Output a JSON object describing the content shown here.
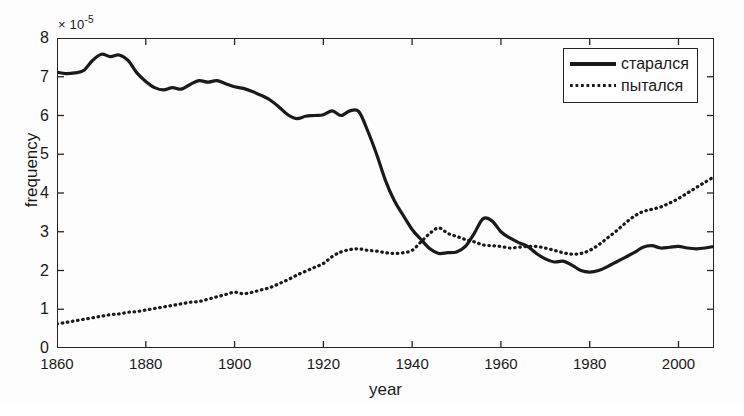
{
  "chart_data": {
    "type": "line",
    "title": "",
    "xlabel": "year",
    "ylabel": "frequency",
    "y_multiplier_times": "× 10",
    "y_multiplier_exponent": "-5",
    "y_multiplier_full": "× 10^-5",
    "xlim": [
      1860,
      2008
    ],
    "ylim": [
      0,
      8
    ],
    "xticks": [
      1860,
      1880,
      1900,
      1920,
      1940,
      1960,
      1980,
      2000
    ],
    "xtick_labels": [
      "1860",
      "1880",
      "1900",
      "1920",
      "1940",
      "1960",
      "1980",
      "2000"
    ],
    "yticks": [
      0,
      1,
      2,
      3,
      4,
      5,
      6,
      7,
      8
    ],
    "ytick_labels": [
      "0",
      "1",
      "2",
      "3",
      "4",
      "5",
      "6",
      "7",
      "8"
    ],
    "grid": false,
    "legend_position": "upper right",
    "legend_entries": [
      {
        "label": "старался",
        "style": "solid"
      },
      {
        "label": "пытался",
        "style": "dotted"
      }
    ],
    "series": [
      {
        "name": "старался",
        "style": "solid",
        "color": "#1a1a1a",
        "x": [
          1860,
          1862,
          1864,
          1866,
          1868,
          1870,
          1872,
          1874,
          1876,
          1878,
          1880,
          1882,
          1884,
          1886,
          1888,
          1890,
          1892,
          1894,
          1896,
          1898,
          1900,
          1902,
          1904,
          1906,
          1908,
          1910,
          1912,
          1914,
          1916,
          1918,
          1920,
          1922,
          1924,
          1926,
          1928,
          1930,
          1932,
          1934,
          1936,
          1938,
          1940,
          1942,
          1944,
          1946,
          1948,
          1950,
          1952,
          1954,
          1956,
          1958,
          1960,
          1962,
          1964,
          1966,
          1968,
          1970,
          1972,
          1974,
          1976,
          1978,
          1980,
          1982,
          1984,
          1986,
          1988,
          1990,
          1992,
          1994,
          1996,
          1998,
          2000,
          2002,
          2004,
          2006,
          2008
        ],
        "y": [
          7.12,
          7.08,
          7.1,
          7.16,
          7.42,
          7.58,
          7.52,
          7.56,
          7.42,
          7.1,
          6.88,
          6.72,
          6.66,
          6.72,
          6.68,
          6.8,
          6.9,
          6.86,
          6.9,
          6.82,
          6.74,
          6.7,
          6.62,
          6.52,
          6.4,
          6.22,
          6.02,
          5.92,
          5.98,
          6.0,
          6.02,
          6.12,
          6.0,
          6.12,
          6.1,
          5.6,
          5.0,
          4.32,
          3.8,
          3.42,
          3.06,
          2.8,
          2.56,
          2.44,
          2.46,
          2.48,
          2.62,
          2.96,
          3.34,
          3.28,
          3.0,
          2.84,
          2.72,
          2.62,
          2.44,
          2.3,
          2.22,
          2.24,
          2.14,
          2.0,
          1.96,
          2.0,
          2.1,
          2.22,
          2.34,
          2.46,
          2.6,
          2.64,
          2.58,
          2.6,
          2.62,
          2.58,
          2.56,
          2.58,
          2.62
        ]
      },
      {
        "name": "пытался",
        "style": "dotted",
        "color": "#1a1a1a",
        "x": [
          1860,
          1862,
          1864,
          1866,
          1868,
          1870,
          1872,
          1874,
          1876,
          1878,
          1880,
          1882,
          1884,
          1886,
          1888,
          1890,
          1892,
          1894,
          1896,
          1898,
          1900,
          1902,
          1904,
          1906,
          1908,
          1910,
          1912,
          1914,
          1916,
          1918,
          1920,
          1922,
          1924,
          1926,
          1928,
          1930,
          1932,
          1934,
          1936,
          1938,
          1940,
          1942,
          1944,
          1946,
          1948,
          1950,
          1952,
          1954,
          1956,
          1958,
          1960,
          1962,
          1964,
          1966,
          1968,
          1970,
          1972,
          1974,
          1976,
          1978,
          1980,
          1982,
          1984,
          1986,
          1988,
          1990,
          1992,
          1994,
          1996,
          1998,
          2000,
          2002,
          2004,
          2006,
          2008
        ],
        "y": [
          0.62,
          0.66,
          0.7,
          0.74,
          0.78,
          0.82,
          0.86,
          0.88,
          0.92,
          0.94,
          0.98,
          1.02,
          1.06,
          1.1,
          1.14,
          1.18,
          1.2,
          1.26,
          1.32,
          1.38,
          1.44,
          1.4,
          1.44,
          1.5,
          1.56,
          1.66,
          1.76,
          1.88,
          1.98,
          2.08,
          2.18,
          2.36,
          2.48,
          2.54,
          2.56,
          2.52,
          2.5,
          2.46,
          2.44,
          2.46,
          2.52,
          2.74,
          2.96,
          3.1,
          2.96,
          2.88,
          2.8,
          2.74,
          2.66,
          2.64,
          2.62,
          2.58,
          2.6,
          2.62,
          2.62,
          2.58,
          2.52,
          2.46,
          2.42,
          2.44,
          2.52,
          2.66,
          2.84,
          3.02,
          3.22,
          3.4,
          3.52,
          3.58,
          3.64,
          3.74,
          3.86,
          4.0,
          4.14,
          4.28,
          4.42
        ]
      }
    ]
  }
}
